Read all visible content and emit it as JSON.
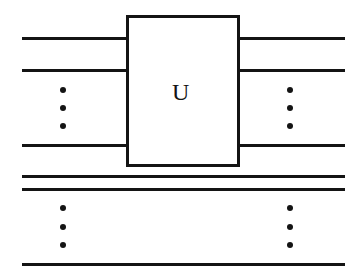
{
  "figure": {
    "kind": "quantum-circuit-diagram",
    "background_color": "#ffffff",
    "ink_color": "#141414",
    "width": 364,
    "height": 280
  },
  "gate": {
    "label": "U",
    "x": 126,
    "y": 15,
    "width": 114,
    "height": 152,
    "stroke_width": 3
  },
  "input_wires": [
    {
      "name": "input-wire-1",
      "x1": 22,
      "x2": 128,
      "y": 38
    },
    {
      "name": "input-wire-2",
      "x1": 22,
      "x2": 128,
      "y": 70
    },
    {
      "name": "input-wire-3",
      "x1": 22,
      "x2": 128,
      "y": 145
    }
  ],
  "output_wires": [
    {
      "name": "output-wire-1",
      "x1": 238,
      "x2": 345,
      "y": 38
    },
    {
      "name": "output-wire-2",
      "x1": 238,
      "x2": 345,
      "y": 70
    },
    {
      "name": "output-wire-3",
      "x1": 238,
      "x2": 345,
      "y": 145
    }
  ],
  "passthrough_wires": [
    {
      "name": "passthrough-wire-1",
      "x1": 22,
      "x2": 345,
      "y": 176
    },
    {
      "name": "passthrough-wire-2",
      "x1": 22,
      "x2": 345,
      "y": 189
    },
    {
      "name": "passthrough-wire-3",
      "x1": 22,
      "x2": 345,
      "y": 264
    }
  ],
  "ellipses": [
    {
      "name": "vertical-ellipsis-input",
      "x": 63,
      "y_top": 88,
      "y_bottom": 126,
      "dot_count": 3
    },
    {
      "name": "vertical-ellipsis-output",
      "x": 290,
      "y_top": 88,
      "y_bottom": 126,
      "dot_count": 3
    },
    {
      "name": "vertical-ellipsis-lower-left",
      "x": 63,
      "y_top": 206,
      "y_bottom": 245,
      "dot_count": 3
    },
    {
      "name": "vertical-ellipsis-lower-right",
      "x": 290,
      "y_top": 206,
      "y_bottom": 245,
      "dot_count": 3
    }
  ]
}
